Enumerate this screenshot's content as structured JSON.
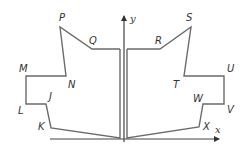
{
  "figure": {
    "axes": {
      "x_label": "x",
      "y_label": "y"
    },
    "left_shape": {
      "vertex_labels": [
        "P",
        "Q",
        "M",
        "N",
        "L",
        "J",
        "K"
      ]
    },
    "right_shape": {
      "vertex_labels": [
        "R",
        "S",
        "T",
        "U",
        "W",
        "V",
        "X"
      ]
    },
    "colors": {
      "shape_stroke": "#6b6b6b",
      "axis_stroke": "#444444",
      "label_color": "#333333"
    }
  }
}
